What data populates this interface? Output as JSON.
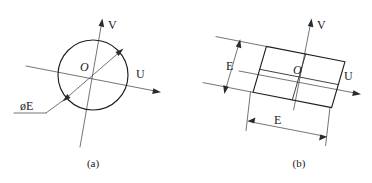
{
  "figure": {
    "background_color": "#ffffff",
    "line_color": "#2b2b2b",
    "panels": [
      {
        "id": "a",
        "caption": "(a)",
        "shape": "circle",
        "axes": [
          {
            "name": "U",
            "label": "U"
          },
          {
            "name": "V",
            "label": "V"
          }
        ],
        "origin_label": "O",
        "dimension_label": "øE",
        "dimension_meaning": "diameter-E"
      },
      {
        "id": "b",
        "caption": "(b)",
        "shape": "square-grid",
        "axes": [
          {
            "name": "U",
            "label": "U"
          },
          {
            "name": "V",
            "label": "V"
          }
        ],
        "origin_label": "O",
        "dimensions": [
          {
            "name": "vertical-side",
            "label": "E"
          },
          {
            "name": "horizontal-side",
            "label": "E"
          }
        ]
      }
    ]
  }
}
